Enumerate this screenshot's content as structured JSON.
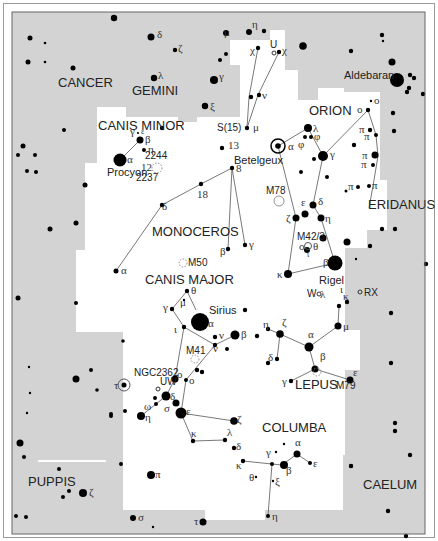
{
  "map": {
    "background_color": "#d3d3d3",
    "region_color": "#ffffff",
    "star_color": "#000000",
    "line_color": "#555555"
  },
  "constellations": {
    "cancer": "CANCER",
    "gemini": "GEMINI",
    "canis_minor": "CANIS MINOR",
    "orion": "ORION",
    "monoceros": "MONOCEROS",
    "eridanus": "ERIDANUS",
    "canis_major": "CANIS MAJOR",
    "lepus": "LEPUS",
    "columba": "COLUMBA",
    "puppis": "PUPPIS",
    "caelum": "CAELUM"
  },
  "named_stars": {
    "aldebaran": "Aldebaran",
    "procyon": "Procyon",
    "betelgeux": "Betelgeux",
    "rigel": "Rigel",
    "sirius": "Sirius"
  },
  "deep_sky": {
    "m78": "M78",
    "m42": "M42/3",
    "m50": "M50",
    "m41": "M41",
    "m79": "M79",
    "ngc2362": "NGC2362",
    "ngc2244": "2244",
    "ngc2237": "2237"
  },
  "variable_stars": {
    "s15": "S(15)",
    "w": "W",
    "rx": "RX",
    "uw": "UW",
    "u": "U"
  },
  "numbers": {
    "n13": "13",
    "n12": "12",
    "n8": "8",
    "n18": "18"
  },
  "greek": {
    "alpha": "α",
    "beta": "β",
    "gamma": "γ",
    "delta": "δ",
    "epsilon": "ε",
    "zeta": "ζ",
    "eta": "η",
    "theta": "θ",
    "iota": "ι",
    "kappa": "κ",
    "lambda": "λ",
    "mu": "μ",
    "nu": "ν",
    "xi": "ξ",
    "omicron": "ο",
    "pi": "π",
    "sigma": "σ",
    "tau": "τ",
    "phi": "φ",
    "chi": "χ",
    "omega": "ω"
  }
}
